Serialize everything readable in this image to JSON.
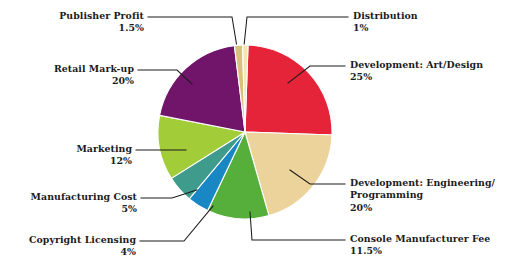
{
  "chart_data": {
    "type": "pie",
    "title": "",
    "subtitle": "",
    "xlabel": "",
    "ylabel": "",
    "legend_position": "callout-labels",
    "grid": false,
    "total": 100,
    "unit": "%",
    "start_angle_deg": -88,
    "direction": "clockwise",
    "categories": [
      "Distribution",
      "Development: Art/Design",
      "Development: Engineering/Programming",
      "Console Manufacturer Fee",
      "Copyright Licensing",
      "Manufacturing Cost",
      "Marketing",
      "Retail Mark-up",
      "Publisher Profit"
    ],
    "values": [
      1,
      25,
      20,
      11.5,
      4,
      5,
      12,
      20,
      1.5
    ],
    "colors": [
      "#F4E6B4",
      "#E52339",
      "#EBD39B",
      "#56AE3B",
      "#1887C4",
      "#3F9B8B",
      "#A3CC39",
      "#71156B",
      "#D9C07C"
    ],
    "slices": [
      {
        "label": "Distribution",
        "value": 1,
        "pct_text": "1%",
        "color": "#F4E6B4"
      },
      {
        "label": "Development: Art/Design",
        "value": 25,
        "pct_text": "25%",
        "color": "#E52339"
      },
      {
        "label": "Development: Engineering/",
        "value": 20,
        "pct_text": "20%",
        "color": "#EBD39B"
      },
      {
        "label": "Console Manufacturer Fee",
        "value": 11.5,
        "pct_text": "11.5%",
        "color": "#56AE3B"
      },
      {
        "label": "Copyright Licensing",
        "value": 4,
        "pct_text": "4%",
        "color": "#1887C4"
      },
      {
        "label": "Manufacturing Cost",
        "value": 5,
        "pct_text": "5%",
        "color": "#3F9B8B"
      },
      {
        "label": "Marketing",
        "value": 12,
        "pct_text": "12%",
        "color": "#A3CC39"
      },
      {
        "label": "Retail Mark-up",
        "value": 20,
        "pct_text": "20%",
        "color": "#71156B"
      },
      {
        "label": "Publisher Profit",
        "value": 1.5,
        "pct_text": "1.5%",
        "color": "#D9C07C"
      }
    ]
  },
  "labels": {
    "publisher_profit": {
      "name": "Publisher Profit",
      "pct": "1.5%"
    },
    "retail_markup": {
      "name": "Retail Mark-up",
      "pct": "20%"
    },
    "marketing": {
      "name": "Marketing",
      "pct": "12%"
    },
    "manufacturing_cost": {
      "name": "Manufacturing Cost",
      "pct": "5%"
    },
    "copyright_licensing": {
      "name": "Copyright Licensing",
      "pct": "4%"
    },
    "distribution": {
      "name": "Distribution",
      "pct": "1%"
    },
    "dev_art_design": {
      "name": "Development: Art/Design",
      "pct": "25%"
    },
    "dev_engineering": {
      "name_line1": "Development: Engineering/",
      "name_line2": "Programming",
      "pct": "20%"
    },
    "console_manufacturer_fee": {
      "name": "Console Manufacturer Fee",
      "pct": "11.5%"
    }
  },
  "style": {
    "background": "#ffffff",
    "text_color": "#1b1b1b",
    "leader_color": "#1b1b1b",
    "slice_gap_color": "#ffffff"
  }
}
